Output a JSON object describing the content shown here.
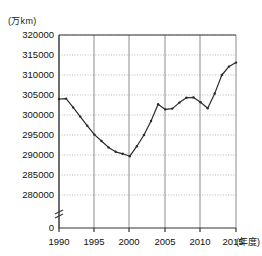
{
  "chart_data": {
    "type": "line",
    "title": "",
    "xlabel": "(年度)",
    "ylabel": "(万km)",
    "ylim": [
      278000,
      320000
    ],
    "xlim": [
      1990,
      2015
    ],
    "grid": true,
    "legend": false,
    "axis_break": true,
    "y_ticks": [
      "0",
      "280000",
      "285000",
      "290000",
      "295000",
      "300000",
      "305000",
      "310000",
      "315000",
      "320000"
    ],
    "x_ticks": [
      "1990",
      "1995",
      "2000",
      "2005",
      "2010",
      "2015"
    ],
    "x": [
      1990,
      1991,
      1992,
      1993,
      1994,
      1995,
      1996,
      1997,
      1998,
      1999,
      2000,
      2001,
      2002,
      2003,
      2004,
      2005,
      2006,
      2007,
      2008,
      2009,
      2010,
      2011,
      2012,
      2013,
      2014,
      2015
    ],
    "values": [
      304000,
      304100,
      301900,
      299600,
      297300,
      295100,
      293500,
      291900,
      290800,
      290300,
      289700,
      292200,
      295000,
      298500,
      302700,
      301400,
      301600,
      303100,
      304300,
      304400,
      303200,
      301700,
      305400,
      310000,
      312100,
      313100
    ],
    "series": [
      {
        "name": "総延長",
        "values": [
          304000,
          304100,
          301900,
          299600,
          297300,
          295100,
          293500,
          291900,
          290800,
          290300,
          289700,
          292200,
          295000,
          298500,
          302700,
          301400,
          301600,
          303100,
          304300,
          304400,
          303200,
          301700,
          305400,
          310000,
          312100,
          313100
        ]
      }
    ]
  },
  "axis": {
    "y_unit_label": "(万km)",
    "x_unit_label": "(年度)",
    "zero_label": "0"
  }
}
